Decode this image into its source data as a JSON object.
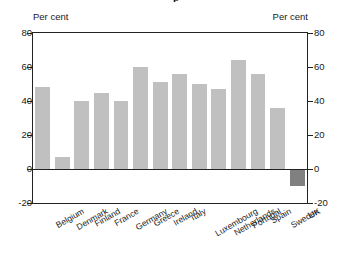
{
  "chart_data": {
    "type": "bar",
    "title": "",
    "subtitle": "",
    "xlabel": "",
    "ylabel": "Per cent",
    "y2label": "Per cent",
    "ylim": [
      -20,
      80
    ],
    "yticks": [
      -20,
      0,
      20,
      40,
      60,
      80
    ],
    "ytick_labels": [
      "-20",
      "0",
      "20",
      "40",
      "60",
      "80"
    ],
    "grid": false,
    "legend": false,
    "legend_position": "none",
    "dual_axis": true,
    "categories": [
      "Belgium",
      "Denmark",
      "Finland",
      "France",
      "Germany",
      "Greece",
      "Ireland",
      "Italy",
      "Luxembourg",
      "Netherlands",
      "Portugal",
      "Spain",
      "Sweden",
      "UK"
    ],
    "values": [
      48,
      7,
      40,
      45,
      40,
      60,
      51,
      56,
      50,
      47,
      64,
      56,
      36,
      -10
    ],
    "bar_colors": [
      "#c0c0c0",
      "#c0c0c0",
      "#c0c0c0",
      "#c0c0c0",
      "#c0c0c0",
      "#c0c0c0",
      "#c0c0c0",
      "#c0c0c0",
      "#c0c0c0",
      "#c0c0c0",
      "#c0c0c0",
      "#c0c0c0",
      "#c0c0c0",
      "#808080"
    ],
    "positive_bar_color": "#c0c0c0",
    "negative_bar_color": "#808080",
    "axis_color": "#222222",
    "text_color": "#1a1a1a",
    "background_color": "#ffffff"
  },
  "axis": {
    "left_caption": "Per cent",
    "right_caption": "Per cent"
  },
  "title_fragment": "p"
}
